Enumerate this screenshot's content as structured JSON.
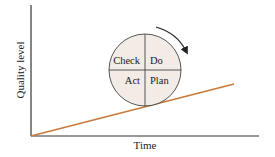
{
  "diagram": {
    "axes": {
      "x_label": "Time",
      "y_label": "Quality level"
    },
    "wheel": {
      "quadrants": {
        "top_left": "Check",
        "top_right": "Do",
        "bottom_left": "Act",
        "bottom_right": "Plan"
      },
      "fill_color": "#f3ebe6",
      "rotation": "clockwise"
    },
    "trend_line": {
      "color": "#c8793a",
      "meaning": "rising quality over time"
    },
    "colors": {
      "axis": "#333333",
      "text": "#222222"
    }
  }
}
